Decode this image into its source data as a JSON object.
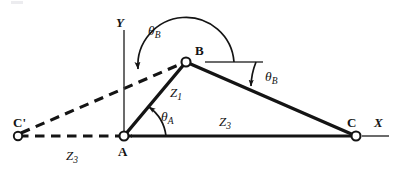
{
  "figure": {
    "type": "mechanism-linkage-diagram",
    "background_color": "#ffffff",
    "stroke_color": "#141414"
  },
  "axes": {
    "x_label": "X",
    "y_label": "Y",
    "x_axis": {
      "name": "x-axis-tick",
      "x1": 362,
      "y1": 136,
      "x2": 388,
      "y2": 136
    },
    "y_axis": {
      "name": "y-axis-line",
      "x1": 124,
      "y1": 30,
      "x2": 124,
      "y2": 136
    }
  },
  "points": [
    {
      "id": "A",
      "label": "A",
      "x": 124,
      "y": 136,
      "label_x": 119,
      "label_y": 146
    },
    {
      "id": "B",
      "label": "B",
      "x": 186,
      "y": 62,
      "label_x": 196,
      "label_y": 46
    },
    {
      "id": "C",
      "label": "C",
      "x": 356,
      "y": 136,
      "label_x": 347,
      "label_y": 118
    },
    {
      "id": "Cp",
      "label": "C'",
      "x": 18,
      "y": 136,
      "label_x": 13,
      "label_y": 118
    }
  ],
  "links": [
    {
      "name": "link-AB",
      "from": "A",
      "to": "B",
      "style": "solid",
      "vector_label": "Z1"
    },
    {
      "name": "link-BC",
      "from": "B",
      "to": "C",
      "style": "solid"
    },
    {
      "name": "link-AC",
      "from": "A",
      "to": "C",
      "style": "solid",
      "vector_label": "Z3"
    },
    {
      "name": "link-CprimeA",
      "from": "Cp",
      "to": "A",
      "style": "dashed",
      "vector_label": "Z3"
    },
    {
      "name": "link-CprimeB",
      "from": "Cp",
      "to": "B",
      "style": "dashed"
    }
  ],
  "vector_labels": [
    {
      "name": "z1-label",
      "base": "Z",
      "sub": "1",
      "x": 170,
      "y": 88
    },
    {
      "name": "z3-upper-label",
      "base": "Z",
      "sub": "3",
      "x": 219,
      "y": 117
    },
    {
      "name": "z3-lower-label",
      "base": "Z",
      "sub": "3",
      "x": 66,
      "y": 150
    }
  ],
  "angles": [
    {
      "name": "theta-A-angle",
      "base": "θ",
      "sub": "A",
      "label_x": 161,
      "label_y": 111,
      "vertex": "A",
      "from_deg": 0,
      "to_deg": 50,
      "radius": 40,
      "description": "angle from +X axis (line AC) to link AB at joint A"
    },
    {
      "name": "theta-B-angle-local",
      "base": "θ",
      "sub": "B",
      "label_x": 265,
      "label_y": 71,
      "vertex": "B",
      "from_deg": 0,
      "to_deg": -24,
      "radius": 70,
      "description": "angle from horizontal reference at B down to link BC"
    },
    {
      "name": "theta-B-angle-global",
      "base": "θ",
      "sub": "B",
      "label_x": 148,
      "label_y": 25,
      "vertex": "B",
      "from_deg": 0,
      "to_deg": 196,
      "radius": 48,
      "description": "reflex angle from horizontal reference at B counter-clockwise to direction B toward C-prime"
    }
  ],
  "reference_lines": [
    {
      "name": "b-horizontal-reference",
      "x1": 205,
      "y1": 62,
      "x2": 263,
      "y2": 62
    }
  ],
  "joints": [
    {
      "name": "joint-A-pivot",
      "point": "A"
    },
    {
      "name": "joint-B-pivot",
      "point": "B"
    },
    {
      "name": "joint-C-pivot",
      "point": "C"
    },
    {
      "name": "joint-Cprime-pivot",
      "point": "Cp"
    }
  ]
}
